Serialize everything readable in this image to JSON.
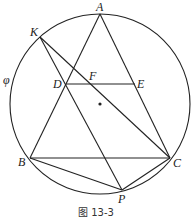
{
  "diagram": {
    "caption": "图 13-3",
    "circle_label": "φ",
    "circle": {
      "cx": 100,
      "cy": 104,
      "r": 90
    },
    "points": {
      "A": {
        "label": "A",
        "x": 100,
        "y": 14
      },
      "K": {
        "label": "K",
        "x": 40,
        "y": 37
      },
      "D": {
        "label": "D",
        "x": 66,
        "y": 84
      },
      "F": {
        "label": "F",
        "x": 92,
        "y": 84
      },
      "E": {
        "label": "E",
        "x": 135,
        "y": 84
      },
      "B": {
        "label": "B",
        "x": 30,
        "y": 158
      },
      "C": {
        "label": "C",
        "x": 170,
        "y": 158
      },
      "P": {
        "label": "P",
        "x": 122,
        "y": 190
      },
      "O": {
        "label": "",
        "x": 100,
        "y": 104
      }
    },
    "segments": [
      [
        "A",
        "B"
      ],
      [
        "A",
        "C"
      ],
      [
        "D",
        "E"
      ],
      [
        "K",
        "P"
      ],
      [
        "K",
        "C"
      ],
      [
        "B",
        "C"
      ],
      [
        "B",
        "P"
      ],
      [
        "P",
        "C"
      ]
    ]
  }
}
